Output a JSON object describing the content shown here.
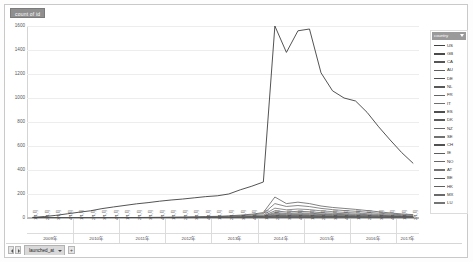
{
  "window": {
    "title_chip": "count of id",
    "sheet_tab": "launched_at",
    "nav_prev": "◀",
    "nav_next": "▶",
    "add_sheet": "+"
  },
  "legend": {
    "header": "country",
    "filter_icon": "chevron-down-icon",
    "items": [
      {
        "label": "US",
        "color": "#404040"
      },
      {
        "label": "GB",
        "color": "#4a4a4a"
      },
      {
        "label": "CA",
        "color": "#555555"
      },
      {
        "label": "AU",
        "color": "#5f5f5f"
      },
      {
        "label": "DE",
        "color": "#4d4d4d"
      },
      {
        "label": "NL",
        "color": "#585858"
      },
      {
        "label": "FR",
        "color": "#636363"
      },
      {
        "label": "IT",
        "color": "#6e6e6e"
      },
      {
        "label": "ES",
        "color": "#4f4f4f"
      },
      {
        "label": "DK",
        "color": "#5a5a5a"
      },
      {
        "label": "NZ",
        "color": "#656565"
      },
      {
        "label": "SE",
        "color": "#707070"
      },
      {
        "label": "CH",
        "color": "#515151"
      },
      {
        "label": "IE",
        "color": "#5c5c5c"
      },
      {
        "label": "NO",
        "color": "#676767"
      },
      {
        "label": "AT",
        "color": "#727272"
      },
      {
        "label": "BE",
        "color": "#535353"
      },
      {
        "label": "HK",
        "color": "#5e5e5e"
      },
      {
        "label": "MX",
        "color": "#696969"
      },
      {
        "label": "LU",
        "color": "#747474"
      }
    ]
  },
  "chart_data": {
    "type": "line",
    "title": "count of id",
    "xlabel": "launched_at",
    "ylabel": "count of id",
    "ylim": [
      0,
      1600
    ],
    "yticks": [
      0,
      200,
      400,
      600,
      800,
      1000,
      1200,
      1400,
      1600
    ],
    "ytick_labels": [
      "0",
      "200",
      "400",
      "600",
      "800",
      "1000",
      "1200",
      "1400",
      "1600"
    ],
    "grid": true,
    "legend_position": "right",
    "x_group_label_suffix": "年",
    "year_groups": [
      {
        "year": "2009年",
        "quarters": 4
      },
      {
        "year": "2010年",
        "quarters": 4
      },
      {
        "year": "2011年",
        "quarters": 4
      },
      {
        "year": "2012年",
        "quarters": 4
      },
      {
        "year": "2013年",
        "quarters": 4
      },
      {
        "year": "2014年",
        "quarters": 4
      },
      {
        "year": "2015年",
        "quarters": 4
      },
      {
        "year": "2016年",
        "quarters": 4
      },
      {
        "year": "2017年",
        "quarters": 2
      }
    ],
    "x": [
      "1/1月",
      "2/1月",
      "3/1月",
      "4/1月",
      "1/1月",
      "2/1月",
      "3/1月",
      "4/1月",
      "1/1月",
      "2/1月",
      "3/1月",
      "4/1月",
      "1/1月",
      "2/1月",
      "3/1月",
      "4/1月",
      "1/1月",
      "2/1月",
      "3/1月",
      "4/1月",
      "1/1月",
      "2/1月",
      "3/1月",
      "4/1月",
      "1/1月",
      "2/1月",
      "3/1月",
      "4/1月",
      "1/1月",
      "2/1月",
      "3/1月",
      "4/1月",
      "1/1月",
      "2/1月"
    ],
    "series": [
      {
        "name": "US",
        "values": [
          5,
          12,
          22,
          35,
          48,
          60,
          78,
          92,
          105,
          118,
          128,
          140,
          150,
          158,
          168,
          178,
          185,
          200,
          235,
          265,
          300,
          1600,
          1380,
          1560,
          1575,
          1210,
          1060,
          1000,
          975,
          880,
          760,
          650,
          545,
          455
        ]
      },
      {
        "name": "GB",
        "values": [
          0,
          0,
          0,
          0,
          0,
          0,
          1,
          2,
          3,
          4,
          5,
          6,
          7,
          8,
          10,
          12,
          14,
          18,
          24,
          32,
          45,
          175,
          120,
          132,
          120,
          100,
          88,
          80,
          72,
          62,
          52,
          42,
          34,
          28
        ]
      },
      {
        "name": "CA",
        "values": [
          0,
          0,
          0,
          0,
          0,
          0,
          0,
          1,
          2,
          3,
          3,
          4,
          5,
          6,
          7,
          9,
          11,
          14,
          19,
          26,
          36,
          120,
          96,
          104,
          95,
          80,
          70,
          62,
          56,
          48,
          40,
          33,
          27,
          22
        ]
      },
      {
        "name": "AU",
        "values": [
          0,
          0,
          0,
          0,
          0,
          0,
          0,
          0,
          1,
          1,
          2,
          2,
          3,
          4,
          5,
          6,
          7,
          9,
          13,
          18,
          25,
          82,
          68,
          75,
          70,
          60,
          53,
          47,
          42,
          36,
          30,
          25,
          20,
          16
        ]
      },
      {
        "name": "DE",
        "values": [
          0,
          0,
          0,
          0,
          0,
          0,
          0,
          0,
          0,
          1,
          1,
          1,
          2,
          2,
          3,
          4,
          5,
          6,
          9,
          13,
          18,
          60,
          50,
          56,
          52,
          45,
          40,
          36,
          32,
          28,
          23,
          19,
          15,
          12
        ]
      },
      {
        "name": "NL",
        "values": [
          0,
          0,
          0,
          0,
          0,
          0,
          0,
          0,
          0,
          0,
          1,
          1,
          1,
          2,
          2,
          3,
          4,
          5,
          7,
          10,
          14,
          46,
          38,
          43,
          40,
          35,
          31,
          28,
          25,
          21,
          18,
          15,
          12,
          10
        ]
      },
      {
        "name": "FR",
        "values": [
          0,
          0,
          0,
          0,
          0,
          0,
          0,
          0,
          0,
          0,
          0,
          1,
          1,
          1,
          2,
          2,
          3,
          4,
          6,
          8,
          11,
          38,
          31,
          35,
          33,
          29,
          26,
          23,
          20,
          17,
          14,
          12,
          10,
          8
        ]
      },
      {
        "name": "IT",
        "values": [
          0,
          0,
          0,
          0,
          0,
          0,
          0,
          0,
          0,
          0,
          0,
          0,
          1,
          1,
          1,
          2,
          2,
          3,
          5,
          7,
          9,
          31,
          26,
          29,
          27,
          24,
          21,
          19,
          17,
          14,
          12,
          10,
          8,
          6
        ]
      },
      {
        "name": "ES",
        "values": [
          0,
          0,
          0,
          0,
          0,
          0,
          0,
          0,
          0,
          0,
          0,
          0,
          0,
          1,
          1,
          1,
          2,
          2,
          4,
          5,
          7,
          25,
          21,
          24,
          22,
          19,
          17,
          15,
          13,
          11,
          9,
          8,
          6,
          5
        ]
      },
      {
        "name": "DK",
        "values": [
          0,
          0,
          0,
          0,
          0,
          0,
          0,
          0,
          0,
          0,
          0,
          0,
          0,
          0,
          1,
          1,
          1,
          2,
          3,
          4,
          6,
          20,
          17,
          19,
          18,
          16,
          14,
          12,
          11,
          9,
          8,
          6,
          5,
          4
        ]
      },
      {
        "name": "NZ",
        "values": [
          0,
          0,
          0,
          0,
          0,
          0,
          0,
          0,
          0,
          0,
          0,
          0,
          0,
          0,
          0,
          1,
          1,
          1,
          2,
          3,
          5,
          17,
          14,
          16,
          15,
          13,
          11,
          10,
          9,
          8,
          6,
          5,
          4,
          3
        ]
      },
      {
        "name": "SE",
        "values": [
          0,
          0,
          0,
          0,
          0,
          0,
          0,
          0,
          0,
          0,
          0,
          0,
          0,
          0,
          0,
          1,
          1,
          1,
          2,
          3,
          4,
          14,
          12,
          13,
          12,
          11,
          9,
          8,
          7,
          6,
          5,
          4,
          3,
          3
        ]
      },
      {
        "name": "CH",
        "values": [
          0,
          0,
          0,
          0,
          0,
          0,
          0,
          0,
          0,
          0,
          0,
          0,
          0,
          0,
          0,
          0,
          1,
          1,
          2,
          2,
          3,
          12,
          10,
          11,
          10,
          9,
          8,
          7,
          6,
          5,
          4,
          4,
          3,
          2
        ]
      },
      {
        "name": "IE",
        "values": [
          0,
          0,
          0,
          0,
          0,
          0,
          0,
          0,
          0,
          0,
          0,
          0,
          0,
          0,
          0,
          0,
          1,
          1,
          1,
          2,
          3,
          10,
          8,
          9,
          9,
          8,
          7,
          6,
          5,
          4,
          4,
          3,
          2,
          2
        ]
      },
      {
        "name": "NO",
        "values": [
          0,
          0,
          0,
          0,
          0,
          0,
          0,
          0,
          0,
          0,
          0,
          0,
          0,
          0,
          0,
          0,
          0,
          1,
          1,
          2,
          2,
          8,
          7,
          8,
          7,
          6,
          6,
          5,
          4,
          4,
          3,
          3,
          2,
          2
        ]
      },
      {
        "name": "AT",
        "values": [
          0,
          0,
          0,
          0,
          0,
          0,
          0,
          0,
          0,
          0,
          0,
          0,
          0,
          0,
          0,
          0,
          0,
          1,
          1,
          1,
          2,
          7,
          6,
          6,
          6,
          5,
          5,
          4,
          4,
          3,
          3,
          2,
          2,
          1
        ]
      },
      {
        "name": "BE",
        "values": [
          0,
          0,
          0,
          0,
          0,
          0,
          0,
          0,
          0,
          0,
          0,
          0,
          0,
          0,
          0,
          0,
          0,
          0,
          1,
          1,
          2,
          6,
          5,
          5,
          5,
          4,
          4,
          3,
          3,
          3,
          2,
          2,
          1,
          1
        ]
      },
      {
        "name": "HK",
        "values": [
          0,
          0,
          0,
          0,
          0,
          0,
          0,
          0,
          0,
          0,
          0,
          0,
          0,
          0,
          0,
          0,
          0,
          0,
          1,
          1,
          1,
          5,
          4,
          4,
          4,
          4,
          3,
          3,
          3,
          2,
          2,
          2,
          1,
          1
        ]
      },
      {
        "name": "MX",
        "values": [
          0,
          0,
          0,
          0,
          0,
          0,
          0,
          0,
          0,
          0,
          0,
          0,
          0,
          0,
          0,
          0,
          0,
          0,
          0,
          1,
          1,
          4,
          3,
          4,
          3,
          3,
          3,
          2,
          2,
          2,
          2,
          1,
          1,
          1
        ]
      },
      {
        "name": "LU",
        "values": [
          0,
          0,
          0,
          0,
          0,
          0,
          0,
          0,
          0,
          0,
          0,
          0,
          0,
          0,
          0,
          0,
          0,
          0,
          0,
          0,
          1,
          3,
          2,
          3,
          3,
          2,
          2,
          2,
          2,
          1,
          1,
          1,
          1,
          1
        ]
      }
    ]
  }
}
